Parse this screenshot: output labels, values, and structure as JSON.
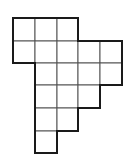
{
  "figure": {
    "type": "polyomino-grid",
    "cell_count": 17,
    "stroke_color": "#1a1a1a",
    "inner_stroke_color": "#555555",
    "fill_color": "#ffffff",
    "origin": {
      "x": 13,
      "y": 18
    },
    "col_edges": [
      13,
      35,
      57,
      78,
      100,
      122
    ],
    "row_edges": [
      18,
      41,
      63,
      85,
      108,
      131,
      153
    ],
    "rows": [
      {
        "row": 0,
        "cols": [
          0,
          1,
          2
        ]
      },
      {
        "row": 1,
        "cols": [
          0,
          1,
          2,
          3,
          4
        ]
      },
      {
        "row": 2,
        "cols": [
          1,
          2,
          3,
          4
        ]
      },
      {
        "row": 3,
        "cols": [
          1,
          2,
          3
        ]
      },
      {
        "row": 4,
        "cols": [
          1,
          2
        ]
      },
      {
        "row": 5,
        "cols": [
          1
        ]
      }
    ]
  }
}
